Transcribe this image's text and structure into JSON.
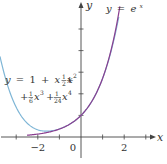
{
  "chart_data": {
    "type": "line",
    "title": "",
    "xlabel": "x",
    "ylabel": "y",
    "xlim": [
      -3.75,
      3.6
    ],
    "ylim": [
      -1,
      6.3
    ],
    "x_ticks": [
      -3,
      -2,
      -1,
      0,
      1,
      2,
      3
    ],
    "x_tick_labels": [
      {
        "value": -2,
        "text": "−2"
      },
      {
        "value": 0,
        "text": "0"
      },
      {
        "value": 2,
        "text": "2"
      }
    ],
    "y_ticks": [
      1,
      2,
      3,
      4,
      5
    ],
    "grid": false,
    "series": [
      {
        "name": "e^x",
        "label": "y = eˣ",
        "function": "exp(x)",
        "domain": [
          -2.5,
          1.8
        ],
        "color": "#8a3f8f"
      },
      {
        "name": "taylor4",
        "label_line1": "y = 1 + x + ½x²",
        "label_line2": "+ ⅙x³ + ¹⁄₂₄x⁴",
        "function": "1 + x + x^2/2 + x^3/6 + x^4/24",
        "domain": [
          -3.75,
          1.75
        ],
        "color": "#7fb6d6"
      }
    ],
    "annotations": {
      "exp_label": {
        "y": "y",
        "eq": "=",
        "e": "e",
        "x": "x"
      },
      "taylor_label": {
        "line1": [
          "y",
          "=",
          "1",
          "+",
          "x",
          "+",
          "1",
          "2",
          "x",
          "2"
        ],
        "line2": [
          "+",
          "1",
          "6",
          "x",
          "3",
          "+",
          "1",
          "24",
          "x",
          "4"
        ]
      }
    }
  }
}
